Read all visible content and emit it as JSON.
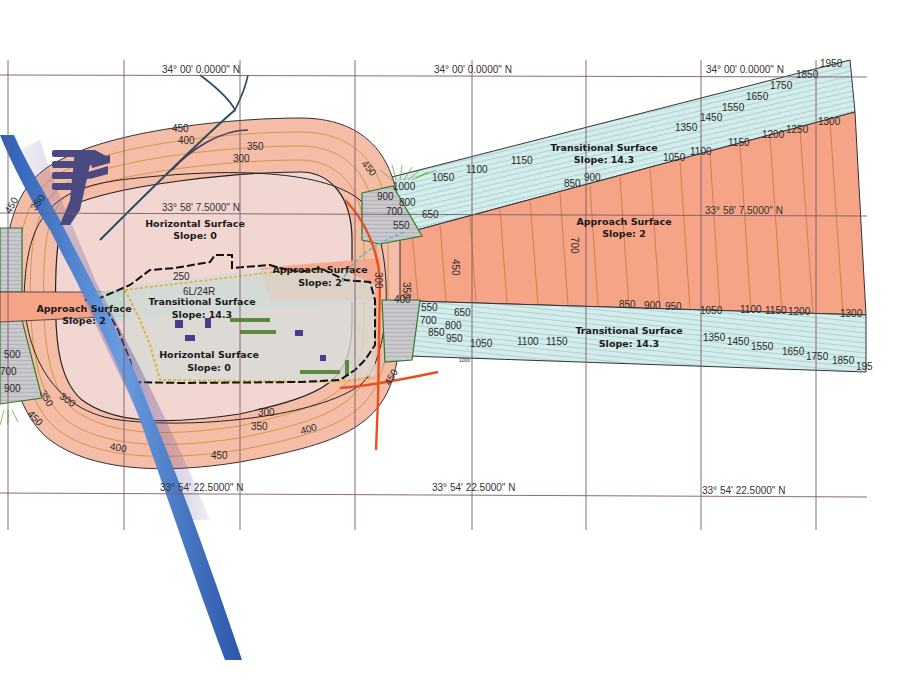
{
  "map": {
    "title": "Airport Imaginary Surfaces (FAR Part 77)",
    "colors": {
      "horizontal_surface_inner": "#f2d4d0",
      "horizontal_surface_outer": "#f5b8a4",
      "approach_surface": "#f5a488",
      "transitional_surface": "#cfe8e8",
      "transitional_gray": "#c4c4c8",
      "grid_line": "#7a5c66",
      "contour_line": "#c8963c",
      "river": "#3f78c8",
      "road": "#e8502a",
      "outline": "#222222"
    },
    "grid_labels": {
      "top_row": [
        "34° 00' 0.0000\" N",
        "34° 00' 0.0000\" N",
        "34° 00' 0.0000\" N"
      ],
      "middle_row": [
        "33° 58' 7.5000\" N",
        "33° 58' 7.5000\" N"
      ],
      "bottom_row": [
        "33° 54' 22.5000\" N",
        "33° 54' 22.5000\" N",
        "33° 54' 22.5000\" N"
      ]
    },
    "surfaces": {
      "horizontal_top": {
        "name": "Horizontal Surface",
        "slope": "Slope: 0"
      },
      "horizontal_bottom": {
        "name": "Horizontal Surface",
        "slope": "Slope: 0"
      },
      "approach_left": {
        "name": "Approach Surface",
        "slope": "Slope: 2"
      },
      "approach_center": {
        "name": "Approach Surface",
        "slope": "Slope: 2"
      },
      "approach_right": {
        "name": "Approach Surface",
        "slope": "Slope: 2"
      },
      "transitional_center": {
        "name": "Transitional Surface",
        "slope": "Slope: 14.3"
      },
      "transitional_upper_right": {
        "name": "Transitional Surface",
        "slope": "Slope: 14.3"
      },
      "transitional_lower_right": {
        "name": "Transitional Surface",
        "slope": "Slope: 14.3"
      }
    },
    "runway_label": "6L/24R",
    "contours": {
      "conical_top": [
        "450",
        "400",
        "350",
        "300"
      ],
      "conical_top_right": "450",
      "conical_left": [
        "450",
        "350"
      ],
      "conical_bottom": [
        "300",
        "350",
        "400",
        "450",
        "400"
      ],
      "conical_bottom_left": [
        "350",
        "300",
        "450"
      ],
      "conical_bottom_right": "450",
      "runway_area": [
        "250",
        "250",
        "250"
      ],
      "approach_near": [
        "300",
        "350",
        "400",
        "450",
        "700"
      ],
      "upper_gray": [
        "1000",
        "900",
        "800",
        "700",
        "550",
        "650"
      ],
      "upper_trans_bottom_edge": [
        "850",
        "900",
        "1050",
        "1100",
        "1150",
        "1200",
        "1250",
        "1300"
      ],
      "upper_trans_top_edge": [
        "1050",
        "1100",
        "1150",
        "1350",
        "1450",
        "1550",
        "1650",
        "1750",
        "1850",
        "1950"
      ],
      "lower_gray": [
        "550",
        "700",
        "850",
        "650",
        "800",
        "950"
      ],
      "lower_trans_top_edge": [
        "850",
        "900",
        "950",
        "1050",
        "1100",
        "1150",
        "1200",
        "1300"
      ],
      "lower_trans_bottom_edge": [
        "1050",
        "1100",
        "1150",
        "1350",
        "1450",
        "1550",
        "1650",
        "1750",
        "1850",
        "195"
      ],
      "left_gray": [
        "500",
        "700",
        "900"
      ],
      "lower_small": "1000"
    }
  }
}
